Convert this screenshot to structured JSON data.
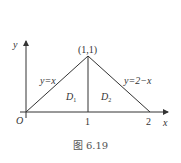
{
  "figure": {
    "caption": "图 6.19",
    "axes": {
      "x_label": "x",
      "y_label": "y",
      "origin_label": "O"
    },
    "ticks": {
      "x1": "1",
      "x2": "2"
    },
    "point_label": "(1,1)",
    "curves": [
      {
        "label": "y=x"
      },
      {
        "label": "y=2−x"
      }
    ],
    "regions": [
      {
        "label": "D",
        "sub": "1"
      },
      {
        "label": "D",
        "sub": "2"
      }
    ],
    "colors": {
      "line": "#333333",
      "background": "#ffffff"
    }
  }
}
